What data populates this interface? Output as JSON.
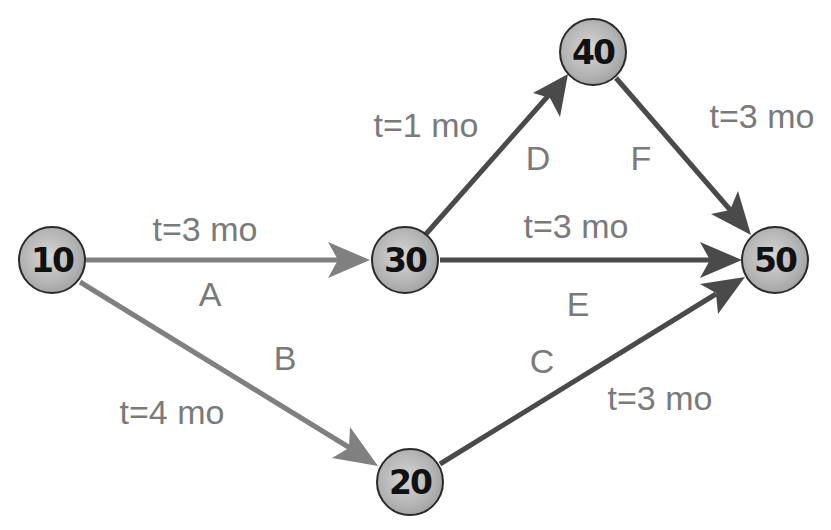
{
  "diagram": {
    "type": "activity-on-arrow network",
    "nodes": [
      {
        "id": "10",
        "label": "10",
        "x": 52,
        "y": 260
      },
      {
        "id": "20",
        "label": "20",
        "x": 410,
        "y": 482
      },
      {
        "id": "30",
        "label": "30",
        "x": 405,
        "y": 260
      },
      {
        "id": "40",
        "label": "40",
        "x": 593,
        "y": 52
      },
      {
        "id": "50",
        "label": "50",
        "x": 775,
        "y": 260
      }
    ],
    "edges": [
      {
        "activity": "A",
        "from": "10",
        "to": "30",
        "duration": "t=3 mo",
        "color": "#808080"
      },
      {
        "activity": "B",
        "from": "10",
        "to": "20",
        "duration": "t=4 mo",
        "color": "#808080"
      },
      {
        "activity": "C",
        "from": "20",
        "to": "50",
        "duration": "t=3 mo",
        "color": "#4a4a4a"
      },
      {
        "activity": "D",
        "from": "30",
        "to": "40",
        "duration": "t=1 mo",
        "color": "#4a4a4a"
      },
      {
        "activity": "E",
        "from": "30",
        "to": "50",
        "duration": "t=3 mo",
        "color": "#4a4a4a"
      },
      {
        "activity": "F",
        "from": "40",
        "to": "50",
        "duration": "t=3 mo",
        "color": "#4a4a4a"
      }
    ],
    "labels": {
      "A": {
        "activity": "A",
        "duration": "t=3 mo"
      },
      "B": {
        "activity": "B",
        "duration": "t=4 mo"
      },
      "C": {
        "activity": "C",
        "duration": "t=3 mo"
      },
      "D": {
        "activity": "D",
        "duration": "t=1 mo"
      },
      "E": {
        "activity": "E",
        "duration": "t=3 mo"
      },
      "F": {
        "activity": "F",
        "duration": "t=3 mo"
      }
    },
    "node_labels": {
      "n10": "10",
      "n20": "20",
      "n30": "30",
      "n40": "40",
      "n50": "50"
    }
  }
}
